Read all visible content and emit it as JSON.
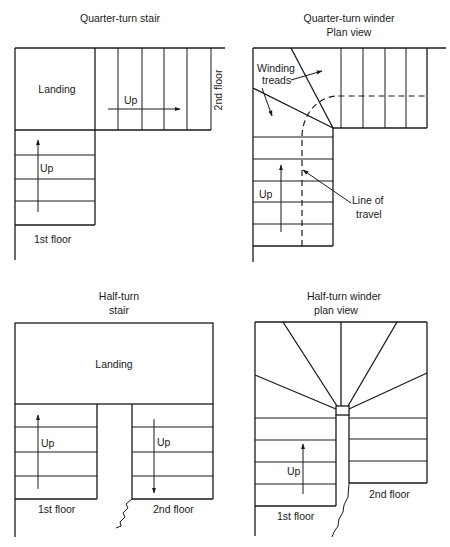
{
  "panels": {
    "quarter_turn_stair": {
      "title": "Quarter-turn stair",
      "landing_label": "Landing",
      "up_label_right_flight": "Up",
      "up_label_lower_flight": "Up",
      "top_floor_label": "2nd floor",
      "bottom_floor_label": "1st floor"
    },
    "quarter_turn_winder": {
      "title_line1": "Quarter-turn winder",
      "title_line2": "Plan view",
      "winding_label_line1": "Winding",
      "winding_label_line2": "treads",
      "up_label": "Up",
      "travel_label_line1": "Line of",
      "travel_label_line2": "travel"
    },
    "half_turn_stair": {
      "title_line1": "Half-turn",
      "title_line2": "stair",
      "landing_label": "Landing",
      "up_label_left": "Up",
      "up_label_right": "Up",
      "left_floor_label": "1st floor",
      "right_floor_label": "2nd floor"
    },
    "half_turn_winder": {
      "title_line1": "Half-turn winder",
      "title_line2": "plan view",
      "up_label": "Up",
      "left_floor_label": "1st floor",
      "right_floor_label": "2nd floor"
    }
  }
}
